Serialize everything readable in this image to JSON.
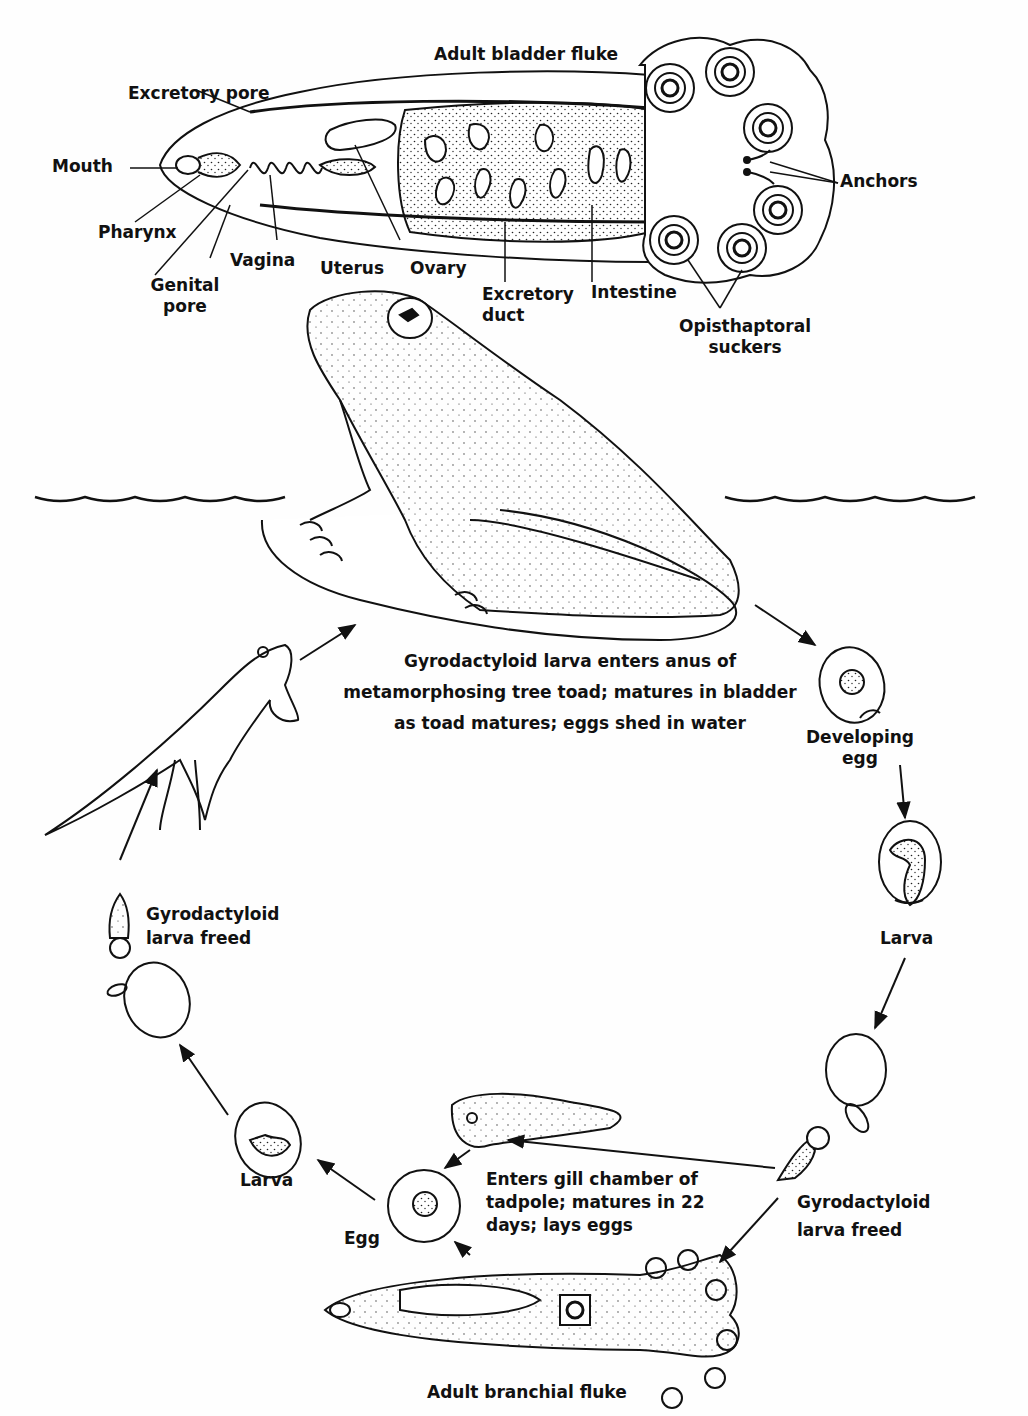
{
  "title": "Adult bladder fluke",
  "bladder_fluke_labels": {
    "excretory_pore": "Excretory pore",
    "mouth": "Mouth",
    "pharynx": "Pharynx",
    "genital_pore": [
      "Genital",
      "pore"
    ],
    "vagina": "Vagina",
    "uterus": "Uterus",
    "ovary": "Ovary",
    "excretory_duct": [
      "Excretory",
      "duct"
    ],
    "intestine": "Intestine",
    "anchors": "Anchors",
    "opisthaptoral_suckers": [
      "Opisthaptoral",
      "suckers"
    ]
  },
  "cycle": {
    "toad_caption": [
      "Gyrodactyloid larva enters anus of",
      "metamorphosing tree toad; matures in bladder",
      "as toad matures; eggs shed in water"
    ],
    "developing_egg": [
      "Developing",
      "egg"
    ],
    "larva_right": "Larva",
    "larva_freed_right": [
      "Gyrodactyloid",
      "larva freed"
    ],
    "tadpole_caption": [
      "Enters gill chamber of",
      "tadpole; matures in 22",
      "days; lays eggs"
    ],
    "egg": "Egg",
    "larva_left": "Larva",
    "larva_freed_left": [
      "Gyrodactyloid",
      "larva freed"
    ],
    "adult_branchial_fluke": "Adult branchial fluke"
  },
  "colors": {
    "ink": "#111111",
    "paper": "#fefefe"
  }
}
